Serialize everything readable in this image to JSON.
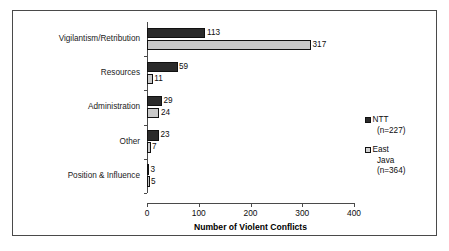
{
  "chart_data": {
    "type": "bar",
    "orientation": "horizontal",
    "title": "",
    "xlabel": "Number of Violent Conflicts",
    "ylabel": "",
    "xlim": [
      0,
      400
    ],
    "xticks": [
      "0",
      "100",
      "200",
      "300",
      "400"
    ],
    "grid": false,
    "legend_position": "right",
    "categories": [
      "Vigilantism/Retribution",
      "Resources",
      "Administration",
      "Other",
      "Position & Influence"
    ],
    "series": [
      {
        "name": "NTT",
        "legend_label": "NTT",
        "legend_sub": "(n=227)",
        "color": "#2b2b2b",
        "values": [
          113,
          59,
          29,
          23,
          3
        ],
        "value_labels": [
          "113",
          "59",
          "29",
          "23",
          "3"
        ]
      },
      {
        "name": "East Java",
        "legend_label": "East",
        "legend_label2": "Java",
        "legend_sub": "(n=364)",
        "color": "#c9c9c9",
        "values": [
          317,
          11,
          24,
          7,
          5
        ],
        "value_labels": [
          "317",
          "11",
          "24",
          "7",
          "5"
        ]
      }
    ]
  },
  "axis": {
    "x_title": "Number of Violent Conflicts",
    "ticks": [
      {
        "label": "0",
        "value": 0
      },
      {
        "label": "100",
        "value": 100
      },
      {
        "label": "200",
        "value": 200
      },
      {
        "label": "300",
        "value": 300
      },
      {
        "label": "400",
        "value": 400
      }
    ]
  },
  "legend": {
    "items": [
      {
        "label": "NTT",
        "sub": "(n=227)",
        "swatch": "dark"
      },
      {
        "label": "East",
        "label2": "Java",
        "sub": "(n=364)",
        "swatch": "light"
      }
    ]
  },
  "colors": {
    "ntt": "#2b2b2b",
    "east_java": "#c9c9c9",
    "frame": "#4a4a4a",
    "text": "#0d0d0d",
    "background": "#ffffff"
  }
}
